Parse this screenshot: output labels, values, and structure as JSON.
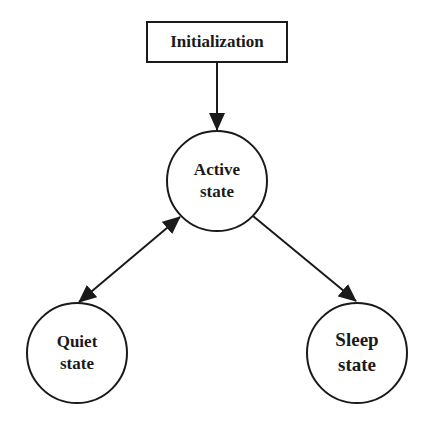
{
  "diagram": {
    "type": "state-transition",
    "colors": {
      "stroke": "#1a1a1a",
      "background": "#ffffff"
    },
    "nodes": {
      "init": {
        "shape": "rectangle",
        "label": "Initialization"
      },
      "active": {
        "shape": "circle",
        "line1": "Active",
        "line2": "state"
      },
      "quiet": {
        "shape": "circle",
        "line1": "Quiet",
        "line2": "state"
      },
      "sleep": {
        "shape": "circle",
        "line1": "Sleep",
        "line2": "state"
      }
    },
    "edges": [
      {
        "from": "Initialization",
        "to": "Active state",
        "direction": "one-way"
      },
      {
        "from": "Active state",
        "to": "Quiet state",
        "direction": "bidirectional"
      },
      {
        "from": "Active state",
        "to": "Sleep state",
        "direction": "one-way"
      }
    ]
  }
}
